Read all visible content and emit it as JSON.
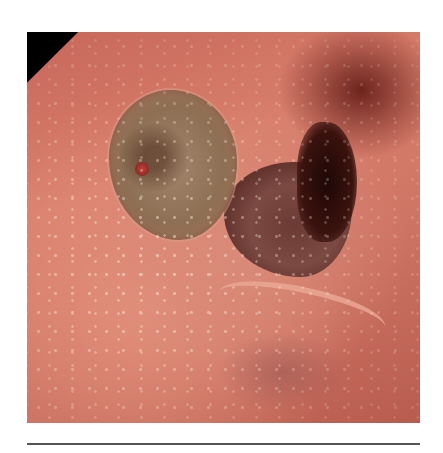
{
  "figure": {
    "type": "endoscopic-photograph",
    "frame": "octagonal-black-corners",
    "colors": {
      "mucosa": "#d97f6d",
      "ulcer_base": "#8d6f54",
      "lumen": "#5a2a24",
      "corners": "#000000",
      "rule": "#555555",
      "background": "#ffffff"
    }
  }
}
